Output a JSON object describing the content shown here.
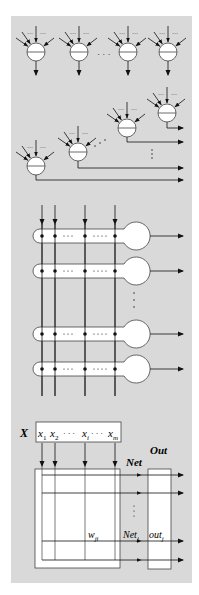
{
  "colors": {
    "panel": "#d9d9d9",
    "line": "#111111",
    "node_fill": "#ffffff"
  },
  "section1": {
    "name": "parallel-neurons",
    "neurons": [
      {
        "cx": 36,
        "cy": 52
      },
      {
        "cx": 79,
        "cy": 52
      },
      {
        "cx": 128,
        "cy": 52
      },
      {
        "cx": 168,
        "cy": 52
      }
    ],
    "ellipsis": "· · ·"
  },
  "section2": {
    "name": "cascaded-neurons",
    "neurons": [
      {
        "cx": 36,
        "cy": 166,
        "out_y": 180
      },
      {
        "cx": 78,
        "cy": 152,
        "out_y": 168
      },
      {
        "cx": 127,
        "cy": 128,
        "out_y": 142
      },
      {
        "cx": 167,
        "cy": 113,
        "out_y": 128
      }
    ]
  },
  "section3": {
    "name": "crossbar-neurons",
    "columns_x": [
      42,
      55,
      85,
      115
    ],
    "rows_y": [
      236,
      271,
      334,
      369
    ]
  },
  "section4": {
    "name": "matrix-form",
    "x_label": "X",
    "inputs": {
      "x1": "x",
      "x1_sub": "1",
      "x2": "x",
      "x2_sub": "2",
      "dots": "· · ·",
      "xi": "x",
      "xi_sub": "i",
      "xm": "x",
      "xm_sub": "m"
    },
    "net_label": "Net",
    "out_label": "Out",
    "weight": "w",
    "weight_sub": "ji",
    "net_j": "Net",
    "net_j_sub": "j",
    "out_j": "out",
    "out_j_sub": "j",
    "rows_y": [
      475,
      493,
      541,
      560
    ]
  }
}
